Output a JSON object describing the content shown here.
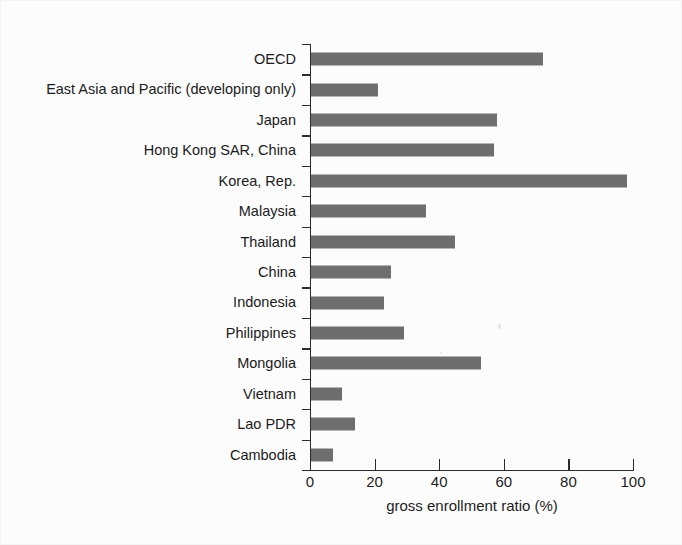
{
  "figure": {
    "background_color": "#fbfbfb",
    "bar_color": "#6e6e6e",
    "axis_color": "#2b2b2b",
    "text_color": "#1c1c1c"
  },
  "chart_data": {
    "type": "bar",
    "orientation": "horizontal",
    "title": "",
    "xlabel": "gross enrollment ratio (%)",
    "ylabel": "",
    "xlim": [
      0,
      100
    ],
    "xticks": [
      0,
      20,
      40,
      60,
      80,
      100
    ],
    "xticklabels": [
      "0",
      "20",
      "40",
      "60",
      "80",
      "100"
    ],
    "grid": false,
    "legend": false,
    "categories": [
      "OECD",
      "East Asia and Pacific (developing only)",
      "Japan",
      "Hong Kong SAR, China",
      "Korea, Rep.",
      "Malaysia",
      "Thailand",
      "China",
      "Indonesia",
      "Philippines",
      "Mongolia",
      "Vietnam",
      "Lao PDR",
      "Cambodia"
    ],
    "values": [
      72,
      21,
      58,
      57,
      98,
      36,
      45,
      25,
      23,
      29,
      53,
      10,
      14,
      7
    ]
  }
}
